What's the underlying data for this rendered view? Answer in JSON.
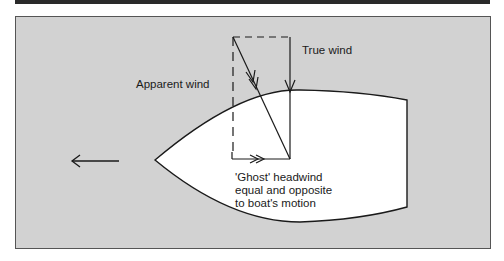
{
  "labels": {
    "true_wind": "True wind",
    "apparent_wind": "Apparent wind",
    "ghost_line1": "'Ghost' headwind",
    "ghost_line2": "equal and opposite",
    "ghost_line3": "to boat's motion"
  },
  "colors": {
    "background": "#d2d2d2",
    "hull_fill": "#ffffff",
    "stroke": "#1a1a1a",
    "top_bar": "#2a2a2a"
  },
  "icons": {
    "motion_arrow": "arrow-left-icon"
  }
}
